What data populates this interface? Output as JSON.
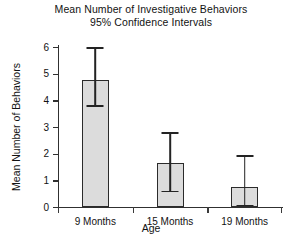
{
  "chart_data": {
    "type": "bar",
    "title": "Mean Number of Investigative Behaviors",
    "subtitle": "95% Confidence Intervals",
    "xlabel": "Age",
    "ylabel": "Mean Number of Behaviors",
    "categories": [
      "9 Months",
      "15 Months",
      "19 Months"
    ],
    "values": [
      4.75,
      1.65,
      0.75
    ],
    "error_low": [
      3.75,
      0.55,
      0.02
    ],
    "error_high": [
      6.0,
      2.8,
      1.95
    ],
    "ylim": [
      0,
      6
    ],
    "yticks": [
      0,
      1,
      2,
      3,
      4,
      5,
      6
    ],
    "ytick_labels": [
      "0",
      "1",
      "2",
      "3",
      "4",
      "5",
      "6"
    ],
    "grid": false,
    "legend": false,
    "bar_fill_color": "#dcdcdc",
    "bar_edge_color": "#2b2b2b",
    "error_bar_color": "#232323",
    "axis_color": "#303030",
    "background_color": "#ffffff"
  }
}
